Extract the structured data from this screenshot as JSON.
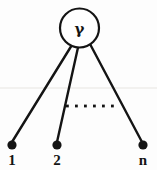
{
  "figure": {
    "type": "star-graph-diagram",
    "background_color": "#fdfdfd",
    "stroke_color": "#141414",
    "hub": {
      "label": "γ",
      "label_name": "gamma",
      "shape": "circle",
      "cx": 79.5,
      "cy": 28,
      "r": 19.5,
      "fill": "#ffffff",
      "stroke_width": 2.2
    },
    "leaves": [
      {
        "label": "1",
        "cx": 12,
        "cy": 145,
        "r": 4.6
      },
      {
        "label": "2",
        "cx": 57,
        "cy": 145,
        "r": 4.6
      },
      {
        "label": "n",
        "cx": 143,
        "cy": 145,
        "r": 4.6
      }
    ],
    "edges": [
      {
        "from": "hub",
        "to": "1",
        "x1": 71,
        "y1": 46.5,
        "x2": 12,
        "y2": 142
      },
      {
        "from": "hub",
        "to": "2",
        "x1": 78,
        "y1": 47.5,
        "x2": 57,
        "y2": 142
      },
      {
        "from": "hub",
        "to": "n",
        "x1": 90,
        "y1": 44,
        "x2": 142,
        "y2": 142
      }
    ],
    "ellipsis": {
      "count": 6,
      "y": 106,
      "x_start": 67,
      "spacing": 9,
      "dot_size": 2.6,
      "meaning": "omitted intermediate leaf nodes"
    },
    "artifact_line": {
      "y": 88,
      "color": "#eeecea",
      "note": "faint horizontal scan artifact"
    }
  }
}
